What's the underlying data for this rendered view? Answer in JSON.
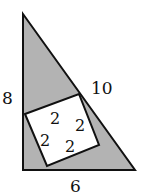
{
  "diagram": {
    "triangle": {
      "fill": "#b3b3b3",
      "stroke": "#111111",
      "vertices": [
        [
          23,
          14
        ],
        [
          23,
          170
        ],
        [
          135,
          170
        ]
      ],
      "labels": {
        "vertical_side": "8",
        "hypotenuse": "10",
        "base": "6"
      }
    },
    "square": {
      "fill": "#ffffff",
      "stroke": "#111111",
      "vertices": [
        [
          25,
          114
        ],
        [
          79,
          94
        ],
        [
          99,
          145
        ],
        [
          47,
          166
        ]
      ],
      "inner_labels": [
        "2",
        "2",
        "2",
        "2"
      ]
    }
  }
}
